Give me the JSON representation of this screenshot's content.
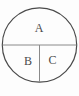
{
  "diagram": {
    "type": "partitioned-circle",
    "regions": [
      {
        "label": "A",
        "position": "top-half"
      },
      {
        "label": "B",
        "position": "bottom-left-quarter"
      },
      {
        "label": "C",
        "position": "bottom-right-quarter"
      }
    ],
    "labels": {
      "a": "A",
      "b": "B",
      "c": "C"
    },
    "colors": {
      "circle_stroke": "#4a4a4a",
      "divider_stroke": "#8a8a8a",
      "label_fill": "#4a4a4a",
      "background": "#fdfdfd"
    }
  }
}
